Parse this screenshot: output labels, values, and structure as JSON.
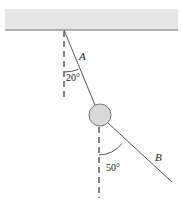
{
  "diagram": {
    "ceiling": {
      "x": 5,
      "y": 9,
      "width": 173,
      "height": 21,
      "fill": "#e4e4e4",
      "edge": "#9a9a9a"
    },
    "attachment": {
      "x": 64,
      "y": 30
    },
    "mass": {
      "cx": 100,
      "cy": 115,
      "r": 11,
      "fill": "#d9d9d9",
      "stroke": "#777777"
    },
    "string_b_end": {
      "x": 172,
      "y": 182
    },
    "labels": {
      "string_a": "A",
      "string_b": "B",
      "angle_a": "20°",
      "angle_b": "50°"
    },
    "colors": {
      "line": "#555555",
      "dash": "#333333"
    }
  }
}
